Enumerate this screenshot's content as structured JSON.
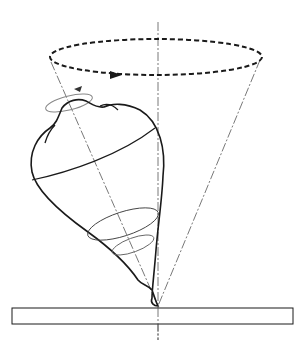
{
  "diagram": {
    "colors": {
      "stroke": "#1a1a1a",
      "light_stroke": "#777777",
      "background": "#ffffff"
    },
    "elements": [
      "vertical-axis",
      "precession-cone",
      "precession-orbit-dashed-ellipse",
      "precession-direction-arrow",
      "spin-direction-ellipse",
      "spin-arrow",
      "top-body",
      "top-equator",
      "top-rings",
      "top-tilted-axis",
      "ground-plate"
    ]
  }
}
